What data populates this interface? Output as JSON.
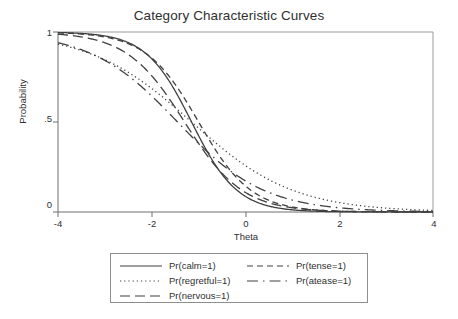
{
  "chart_data": {
    "type": "line",
    "title": "Category Characteristic Curves",
    "xlabel": "Theta",
    "ylabel": "Probability",
    "xlim": [
      -4,
      4
    ],
    "ylim": [
      0,
      1
    ],
    "grid": false,
    "legend_position": "bottom",
    "xticks": [
      -4,
      -2,
      0,
      2,
      4
    ],
    "xtick_labels": [
      "-4",
      "-2",
      "0",
      "2",
      "4"
    ],
    "yticks": [
      0,
      0.5,
      1
    ],
    "ytick_labels": [
      "0",
      ".5",
      "1"
    ],
    "x": [
      -4,
      -3.6,
      -3.2,
      -2.8,
      -2.4,
      -2,
      -1.6,
      -1.2,
      -0.8,
      -0.4,
      0,
      0.4,
      0.8,
      1.2,
      1.6,
      2,
      2.4,
      2.8,
      3.2,
      3.6,
      4
    ],
    "series": [
      {
        "name": "Pr(calm=1)",
        "style": "solid",
        "a": 2.05,
        "b": -1.15,
        "values": [
          0.998,
          0.996,
          0.991,
          0.979,
          0.952,
          0.896,
          0.791,
          0.621,
          0.415,
          0.234,
          0.117,
          0.054,
          0.024,
          0.011,
          0.005,
          0.002,
          0.001,
          0.0004,
          0.0002,
          0.0001,
          4e-05
        ]
      },
      {
        "name": "Pr(regretful=1)",
        "style": "dotted",
        "a": 0.92,
        "b": -1.15,
        "values": [
          0.915,
          0.891,
          0.862,
          0.827,
          0.786,
          0.736,
          0.68,
          0.616,
          0.547,
          0.476,
          0.405,
          0.338,
          0.277,
          0.223,
          0.177,
          0.139,
          0.108,
          0.083,
          0.063,
          0.048,
          0.036
        ]
      },
      {
        "name": "Pr(nervous=1)",
        "style": "longdash",
        "a": 1.62,
        "b": -1.3,
        "values": [
          0.988,
          0.977,
          0.957,
          0.921,
          0.859,
          0.762,
          0.63,
          0.478,
          0.332,
          0.213,
          0.129,
          0.075,
          0.042,
          0.023,
          0.012,
          0.007,
          0.004,
          0.002,
          0.001,
          0.0005,
          0.0003
        ]
      },
      {
        "name": "Pr(tense=1)",
        "style": "dash",
        "a": 1.78,
        "b": -1.0,
        "values": [
          0.995,
          0.99,
          0.98,
          0.959,
          0.92,
          0.851,
          0.743,
          0.596,
          0.432,
          0.283,
          0.171,
          0.097,
          0.053,
          0.028,
          0.014,
          0.007,
          0.004,
          0.002,
          0.001,
          0.0005,
          0.0002
        ]
      },
      {
        "name": "Pr(atease=1)",
        "style": "dashdot",
        "a": 1.08,
        "b": -1.45,
        "values": [
          0.94,
          0.919,
          0.892,
          0.858,
          0.815,
          0.763,
          0.701,
          0.631,
          0.555,
          0.476,
          0.398,
          0.325,
          0.26,
          0.204,
          0.157,
          0.12,
          0.09,
          0.067,
          0.05,
          0.037,
          0.027
        ]
      }
    ]
  },
  "legend": {
    "entries": [
      {
        "label": "Pr(calm=1)",
        "style": "solid"
      },
      {
        "label": "Pr(tense=1)",
        "style": "dash"
      },
      {
        "label": "Pr(regretful=1)",
        "style": "dotted"
      },
      {
        "label": "Pr(atease=1)",
        "style": "dashdot"
      },
      {
        "label": "Pr(nervous=1)",
        "style": "longdash"
      }
    ]
  },
  "colors": {
    "line": "#404040",
    "axis": "#8e8e8e",
    "text": "#2f2f2f",
    "background": "#ffffff"
  }
}
